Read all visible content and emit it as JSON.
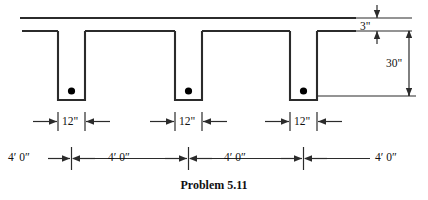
{
  "figure": {
    "caption": "Problem 5.11",
    "type": "reinforced-concrete-tee-beam-cross-section"
  },
  "colors": {
    "line": "#2b2b2b",
    "rebar": "#000000",
    "background": "#ffffff",
    "text": "#111111"
  },
  "dimensions": {
    "slab_thickness": "3\"",
    "total_depth": "30\"",
    "stem_width_1": "12\"",
    "stem_width_2": "12\"",
    "stem_width_3": "12\""
  },
  "spans": {
    "span_1": "4′ 0″",
    "span_2": "4′ 0″",
    "span_3": "4′ 0″",
    "span_4": "4′ 0″"
  },
  "geometry": {
    "slab_top_y": 18,
    "slab_bottom_y": 31,
    "stem_bottom_y": 100,
    "stem_width_px": 27,
    "stems_x": [
      58,
      175,
      290
    ],
    "rebar_y": 91,
    "rebar_radius": 3.6
  }
}
